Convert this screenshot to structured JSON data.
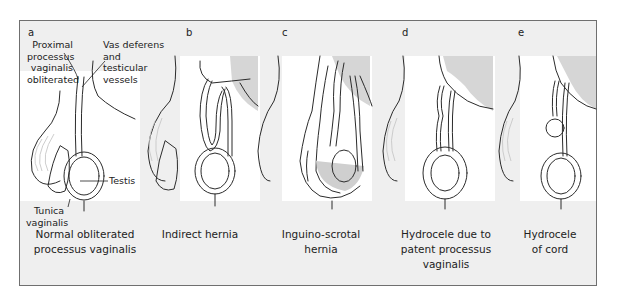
{
  "figure": {
    "colors": {
      "frame_border": "#6f6f6f",
      "background": "#efefef",
      "illustration_panel": "#ffffff",
      "shaded_region": "#d6d6d6",
      "fluid_fill": "#cfcfcf",
      "line": "#2b2b2b"
    },
    "panels": [
      {
        "letter": "a",
        "caption_line1": "Normal obliterated",
        "caption_line2": "processus vaginalis",
        "labels": {
          "proximal_1": "Proximal",
          "proximal_2": "processus",
          "proximal_3": "vaginalis",
          "proximal_4": "obliterated",
          "vas_1": "Vas deferens",
          "vas_2": "and",
          "vas_3": "testicular",
          "vas_4": "vessels",
          "testis": "Testis",
          "tunica_1": "Tunica",
          "tunica_2": "vaginalis"
        }
      },
      {
        "letter": "b",
        "caption_line1": "Indirect hernia",
        "caption_line2": ""
      },
      {
        "letter": "c",
        "caption_line1": "Inguino-scrotal",
        "caption_line2": "hernia"
      },
      {
        "letter": "d",
        "caption_line1": "Hydrocele due to",
        "caption_line2": "patent processus",
        "caption_line3": "vaginalis"
      },
      {
        "letter": "e",
        "caption_line1": "Hydrocele",
        "caption_line2": "of cord"
      }
    ]
  }
}
